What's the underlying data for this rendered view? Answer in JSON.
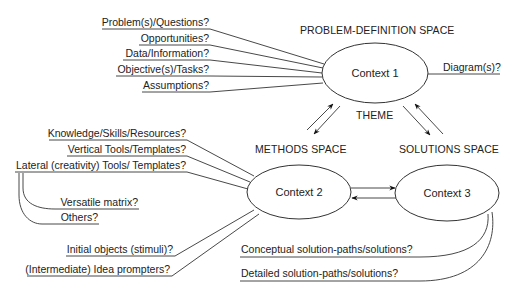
{
  "diagram": {
    "spaces": {
      "problem_definition": "PROBLEM-DEFINITION SPACE",
      "theme": "THEME",
      "methods": "METHODS SPACE",
      "solutions": "SOLUTIONS SPACE"
    },
    "contexts": {
      "context1": "Context 1",
      "context2": "Context 2",
      "context3": "Context 3"
    },
    "problem_inputs": [
      "Problem(s)/Questions?",
      "Opportunities?",
      "Data/Information?",
      "Objective(s)/Tasks?",
      "Assumptions?"
    ],
    "problem_output": "Diagram(s)?",
    "methods_inputs": [
      "Knowledge/Skills/Resources?",
      "Vertical Tools/Templates?",
      "Lateral (creativity) Tools/ Templates?"
    ],
    "lateral_subitems": [
      "Versatile matrix?",
      "Others?"
    ],
    "methods_lower_inputs": [
      "Initial objects (stimuli)?",
      "(Intermediate) Idea prompters?"
    ],
    "solution_outputs": [
      "Conceptual solution-paths/solutions?",
      "Detailed solution-paths/solutions?"
    ]
  }
}
